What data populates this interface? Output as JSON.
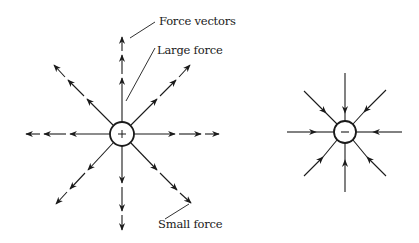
{
  "diagram": {
    "type": "electric field force vectors",
    "positive_charge": {
      "symbol": "+",
      "center": [
        122,
        134
      ],
      "radius": 12,
      "direction": "outward",
      "vectors": 8
    },
    "negative_charge": {
      "symbol": "−",
      "center": [
        345,
        132
      ],
      "radius": 11,
      "direction": "inward",
      "vectors": 8
    },
    "labels": {
      "force_vectors": "Force vectors",
      "large_force": "Large force",
      "small_force": "Small force"
    },
    "colors": {
      "ink": "#1a1a1a",
      "background": "#ffffff"
    }
  }
}
